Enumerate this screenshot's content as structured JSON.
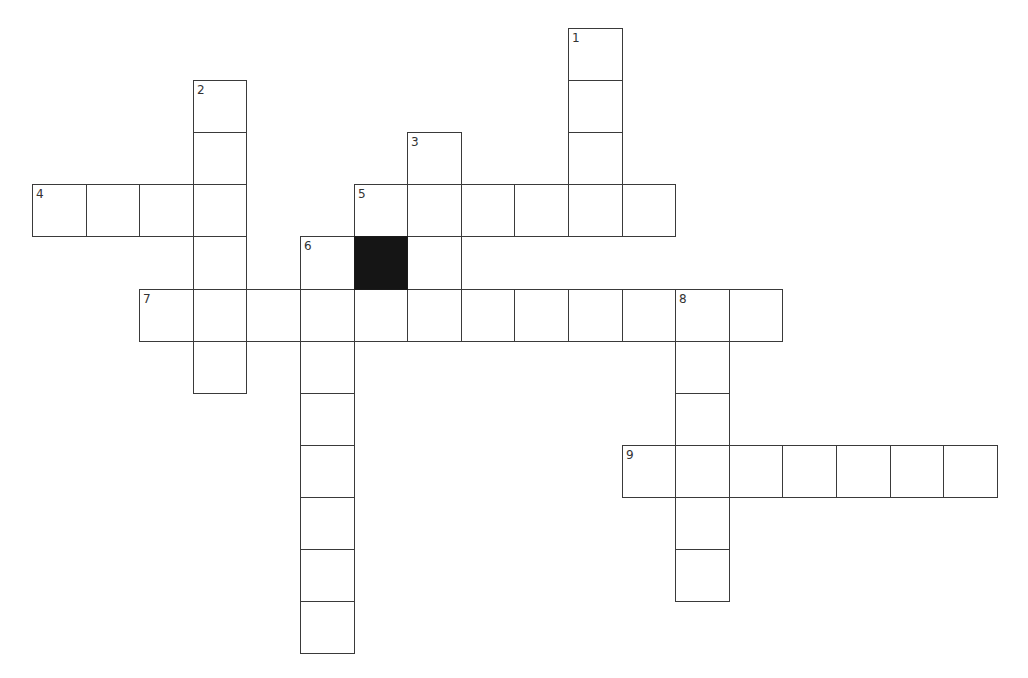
{
  "puzzle": {
    "type": "crossword",
    "grid": {
      "origin_x": 32,
      "origin_y": 28,
      "cell_w": 53.6,
      "cell_h": 52.1,
      "cols": 18,
      "rows": 12
    },
    "colors": {
      "background": "#ffffff",
      "line": "#3a3a3a",
      "block": "#151515",
      "number": "#333333"
    },
    "entries": [
      {
        "number": "1",
        "direction": "down",
        "row": 0,
        "col": 10,
        "length": 4,
        "answer": ""
      },
      {
        "number": "2",
        "direction": "down",
        "row": 1,
        "col": 3,
        "length": 6,
        "answer": ""
      },
      {
        "number": "3",
        "direction": "down",
        "row": 2,
        "col": 7,
        "length": 4,
        "answer": ""
      },
      {
        "number": "4",
        "direction": "across",
        "row": 3,
        "col": 0,
        "length": 4,
        "answer": ""
      },
      {
        "number": "5",
        "direction": "across",
        "row": 3,
        "col": 6,
        "length": 6,
        "answer": ""
      },
      {
        "number": "6",
        "direction": "down",
        "row": 4,
        "col": 5,
        "length": 8,
        "answer": ""
      },
      {
        "number": "7",
        "direction": "across",
        "row": 5,
        "col": 2,
        "length": 12,
        "answer": ""
      },
      {
        "number": "8",
        "direction": "down",
        "row": 5,
        "col": 12,
        "length": 6,
        "answer": ""
      },
      {
        "number": "9",
        "direction": "across",
        "row": 8,
        "col": 11,
        "length": 7,
        "answer": ""
      }
    ],
    "blocks": [
      {
        "row": 4,
        "col": 6
      }
    ]
  }
}
